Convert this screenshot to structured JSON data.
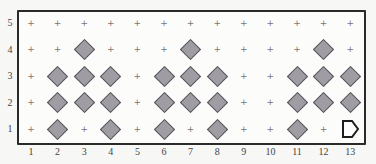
{
  "grid": {
    "columns": 13,
    "rows": 5,
    "column_labels": [
      "1",
      "2",
      "3",
      "4",
      "5",
      "6",
      "7",
      "8",
      "9",
      "10",
      "11",
      "12",
      "13"
    ],
    "row_labels": [
      "5",
      "4",
      "3",
      "2",
      "1"
    ],
    "empty_marker": "+",
    "colors": {
      "diamond_fill": "#a09ca4",
      "diamond_stroke": "#555158",
      "frame": "#2a2a2a",
      "background": "#fcfcfb"
    },
    "cells": [
      {
        "row": 4,
        "cols": [
          3,
          7,
          12
        ],
        "type": "diamond"
      },
      {
        "row": 3,
        "cols": [
          2,
          3,
          4,
          6,
          7,
          8,
          11,
          12,
          13
        ],
        "type": "diamond"
      },
      {
        "row": 2,
        "cols": [
          2,
          3,
          4,
          6,
          7,
          8,
          11,
          12,
          13
        ],
        "type": "diamond"
      },
      {
        "row": 1,
        "cols": [
          2,
          4,
          6,
          8,
          11
        ],
        "type": "diamond"
      },
      {
        "row": 1,
        "cols": [
          13
        ],
        "type": "pentagon-arrow"
      }
    ]
  }
}
